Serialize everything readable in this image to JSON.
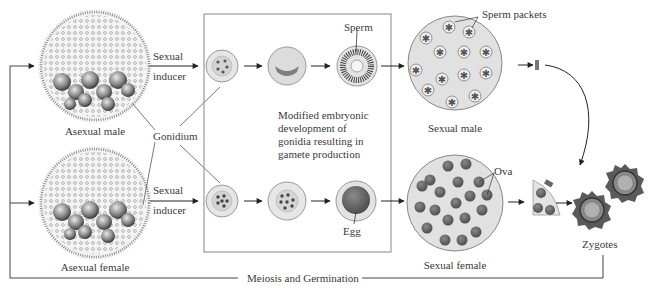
{
  "diagram": {
    "organisms": {
      "asexual_male": "Asexual male",
      "asexual_female": "Asexual female",
      "sexual_male": "Sexual male",
      "sexual_female": "Sexual female"
    },
    "labels": {
      "sexual_inducer_top": [
        "Sexual",
        "inducer"
      ],
      "sexual_inducer_bottom": [
        "Sexual",
        "inducer"
      ],
      "gonidium": "Gonidium",
      "sperm": "Sperm",
      "egg": "Egg",
      "sperm_packets": "Sperm packets",
      "ova": "Ova",
      "zygotes": "Zygotes",
      "meiosis": "Meiosis and Germination",
      "box_caption": [
        "Modified embryonic",
        "development of",
        "gonidia resulting in",
        "gamete production"
      ]
    },
    "colors": {
      "line": "#555555",
      "cell_fill": "#e2e2e2",
      "dark_cell": "#6a6a6a",
      "box_border": "#9a9a9a"
    }
  }
}
